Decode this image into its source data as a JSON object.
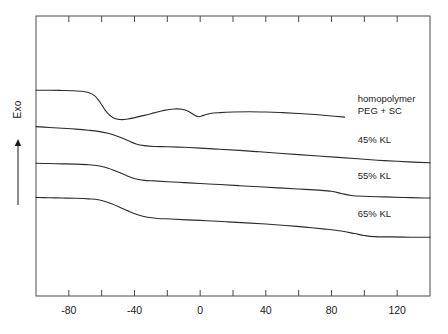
{
  "chart_data": {
    "type": "line",
    "title": "",
    "xlabel": "",
    "ylabel": "Exo",
    "ylabel_arrow": "↑",
    "xlim": [
      -100,
      140
    ],
    "ylim": [
      0,
      1
    ],
    "grid": false,
    "legend_position": "right-inline",
    "axis": {
      "x_major_ticks": [
        -80,
        -40,
        0,
        40,
        80,
        120
      ],
      "x_minor_ticks": [
        -100,
        -60,
        -20,
        20,
        60,
        100,
        140
      ],
      "x_tick_labels": [
        "-80",
        "-40",
        "0",
        "40",
        "80",
        "120"
      ],
      "x_tick_interval": 20,
      "y_ticks_visible": false,
      "frame": "box"
    },
    "series": [
      {
        "name": "homopolymer PEG + SC",
        "label_lines": [
          "homopolymer",
          "PEG + SC"
        ],
        "points": [
          [
            -100,
            0.735
          ],
          [
            -92,
            0.735
          ],
          [
            -84,
            0.734
          ],
          [
            -78,
            0.733
          ],
          [
            -72,
            0.731
          ],
          [
            -68,
            0.727
          ],
          [
            -64,
            0.714
          ],
          [
            -61,
            0.692
          ],
          [
            -58,
            0.665
          ],
          [
            -55,
            0.645
          ],
          [
            -52,
            0.634
          ],
          [
            -48,
            0.63
          ],
          [
            -44,
            0.632
          ],
          [
            -40,
            0.637
          ],
          [
            -34,
            0.645
          ],
          [
            -28,
            0.654
          ],
          [
            -22,
            0.663
          ],
          [
            -16,
            0.668
          ],
          [
            -11,
            0.667
          ],
          [
            -7,
            0.659
          ],
          [
            -4,
            0.648
          ],
          [
            -1,
            0.64
          ],
          [
            2,
            0.645
          ],
          [
            6,
            0.652
          ],
          [
            12,
            0.655
          ],
          [
            20,
            0.657
          ],
          [
            30,
            0.658
          ],
          [
            40,
            0.657
          ],
          [
            50,
            0.655
          ],
          [
            60,
            0.652
          ],
          [
            70,
            0.648
          ],
          [
            80,
            0.643
          ],
          [
            88,
            0.639
          ]
        ]
      },
      {
        "name": "45% KL",
        "label_lines": [
          "45% KL"
        ],
        "points": [
          [
            -100,
            0.605
          ],
          [
            -92,
            0.602
          ],
          [
            -84,
            0.599
          ],
          [
            -76,
            0.596
          ],
          [
            -68,
            0.592
          ],
          [
            -62,
            0.588
          ],
          [
            -56,
            0.581
          ],
          [
            -50,
            0.57
          ],
          [
            -44,
            0.555
          ],
          [
            -39,
            0.543
          ],
          [
            -34,
            0.537
          ],
          [
            -28,
            0.534
          ],
          [
            -20,
            0.533
          ],
          [
            -10,
            0.531
          ],
          [
            0,
            0.528
          ],
          [
            12,
            0.524
          ],
          [
            24,
            0.52
          ],
          [
            36,
            0.515
          ],
          [
            48,
            0.51
          ],
          [
            60,
            0.505
          ],
          [
            72,
            0.5
          ],
          [
            84,
            0.495
          ],
          [
            96,
            0.49
          ],
          [
            108,
            0.485
          ],
          [
            120,
            0.481
          ],
          [
            130,
            0.478
          ],
          [
            140,
            0.476
          ]
        ]
      },
      {
        "name": "55% KL",
        "label_lines": [
          "55% KL"
        ],
        "points": [
          [
            -100,
            0.474
          ],
          [
            -92,
            0.473
          ],
          [
            -84,
            0.472
          ],
          [
            -76,
            0.471
          ],
          [
            -68,
            0.469
          ],
          [
            -62,
            0.465
          ],
          [
            -56,
            0.456
          ],
          [
            -50,
            0.443
          ],
          [
            -44,
            0.428
          ],
          [
            -39,
            0.418
          ],
          [
            -34,
            0.413
          ],
          [
            -28,
            0.411
          ],
          [
            -20,
            0.408
          ],
          [
            -10,
            0.405
          ],
          [
            0,
            0.402
          ],
          [
            12,
            0.398
          ],
          [
            24,
            0.394
          ],
          [
            36,
            0.39
          ],
          [
            48,
            0.386
          ],
          [
            60,
            0.382
          ],
          [
            72,
            0.378
          ],
          [
            80,
            0.374
          ],
          [
            86,
            0.366
          ],
          [
            92,
            0.359
          ],
          [
            100,
            0.356
          ],
          [
            112,
            0.354
          ],
          [
            124,
            0.352
          ],
          [
            136,
            0.35
          ],
          [
            140,
            0.35
          ]
        ]
      },
      {
        "name": "65% KL",
        "label_lines": [
          "65% KL"
        ],
        "points": [
          [
            -100,
            0.352
          ],
          [
            -92,
            0.351
          ],
          [
            -84,
            0.35
          ],
          [
            -76,
            0.349
          ],
          [
            -68,
            0.347
          ],
          [
            -62,
            0.344
          ],
          [
            -56,
            0.334
          ],
          [
            -50,
            0.32
          ],
          [
            -44,
            0.304
          ],
          [
            -38,
            0.29
          ],
          [
            -32,
            0.281
          ],
          [
            -26,
            0.277
          ],
          [
            -18,
            0.275
          ],
          [
            -8,
            0.272
          ],
          [
            4,
            0.269
          ],
          [
            16,
            0.265
          ],
          [
            28,
            0.261
          ],
          [
            40,
            0.257
          ],
          [
            52,
            0.252
          ],
          [
            64,
            0.246
          ],
          [
            76,
            0.239
          ],
          [
            86,
            0.232
          ],
          [
            94,
            0.223
          ],
          [
            100,
            0.216
          ],
          [
            106,
            0.212
          ],
          [
            116,
            0.211
          ],
          [
            128,
            0.21
          ],
          [
            140,
            0.21
          ]
        ]
      }
    ],
    "annotations": [
      {
        "text": "homopolymer\nPEG + SC",
        "x": 96,
        "y": 0.7
      },
      {
        "text": "45% KL",
        "x": 96,
        "y": 0.555
      },
      {
        "text": "55% KL",
        "x": 96,
        "y": 0.425
      },
      {
        "text": "65% KL",
        "x": 96,
        "y": 0.288
      }
    ],
    "style": {
      "line_color": "#2b2b2b",
      "frame_color": "#4a4a4a",
      "background": "#ffffff",
      "line_width": 1.1
    }
  }
}
